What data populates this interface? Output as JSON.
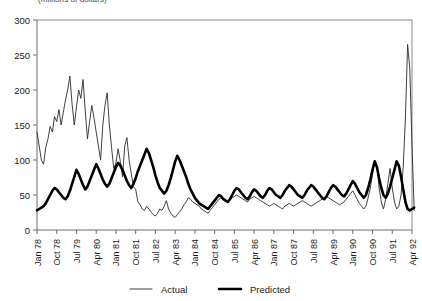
{
  "chart_data": {
    "type": "line",
    "title": "(millions of dollars)",
    "xlabel": "",
    "ylabel": "",
    "ylim": [
      0,
      300
    ],
    "ytick_values": [
      0,
      50,
      100,
      150,
      200,
      250,
      300
    ],
    "ytick_labels": [
      "0",
      "50",
      "100",
      "150",
      "200",
      "250",
      "300"
    ],
    "grid": false,
    "legend_position": "bottom",
    "x_tick_labels": [
      "Jan 78",
      "Oct 78",
      "Jul 79",
      "Apr 80",
      "Jan 81",
      "Oct 81",
      "Jul 82",
      "Apr 83",
      "Jan 84",
      "Oct 84",
      "Jul 85",
      "Apr 86",
      "Jan 87",
      "Oct 87",
      "Jul 88",
      "Apr 89",
      "Jan 90",
      "Oct 90",
      "Jul 91",
      "Apr 92"
    ],
    "x_tick_indices": [
      0,
      9,
      18,
      27,
      36,
      45,
      54,
      63,
      72,
      81,
      90,
      99,
      108,
      117,
      126,
      135,
      144,
      153,
      162,
      171
    ],
    "x_label_rotation": -90,
    "n_points": 172,
    "series": [
      {
        "name": "Actual",
        "line_style": "thin",
        "color": "#2b2b2b",
        "values": [
          140,
          120,
          100,
          94,
          118,
          130,
          148,
          140,
          162,
          155,
          172,
          150,
          168,
          186,
          200,
          220,
          180,
          150,
          176,
          200,
          188,
          215,
          170,
          130,
          155,
          178,
          160,
          140,
          120,
          100,
          150,
          178,
          196,
          150,
          118,
          88,
          96,
          116,
          98,
          76,
          120,
          132,
          100,
          80,
          62,
          58,
          40,
          36,
          30,
          28,
          34,
          30,
          26,
          22,
          20,
          24,
          30,
          28,
          34,
          42,
          30,
          24,
          20,
          18,
          22,
          26,
          30,
          36,
          40,
          46,
          44,
          40,
          38,
          36,
          34,
          30,
          28,
          26,
          24,
          28,
          32,
          36,
          40,
          44,
          46,
          44,
          42,
          40,
          44,
          46,
          48,
          50,
          48,
          46,
          44,
          42,
          40,
          44,
          46,
          48,
          46,
          44,
          42,
          40,
          38,
          36,
          34,
          36,
          38,
          36,
          34,
          32,
          30,
          34,
          36,
          38,
          36,
          34,
          36,
          38,
          40,
          42,
          40,
          38,
          36,
          34,
          36,
          38,
          40,
          42,
          44,
          46,
          48,
          46,
          44,
          42,
          40,
          38,
          36,
          38,
          40,
          44,
          48,
          52,
          56,
          50,
          44,
          38,
          34,
          30,
          34,
          46,
          60,
          80,
          100,
          92,
          60,
          40,
          30,
          44,
          66,
          88,
          60,
          40,
          30,
          34,
          50,
          90,
          160,
          265,
          230,
          120,
          28
        ]
      },
      {
        "name": "Predicted",
        "line_style": "thick",
        "color": "#000000",
        "values": [
          28,
          30,
          32,
          34,
          38,
          44,
          50,
          56,
          60,
          58,
          54,
          50,
          46,
          44,
          48,
          56,
          66,
          76,
          86,
          80,
          72,
          64,
          58,
          62,
          70,
          78,
          86,
          94,
          88,
          80,
          72,
          66,
          62,
          66,
          74,
          82,
          90,
          96,
          92,
          86,
          78,
          70,
          64,
          60,
          66,
          74,
          84,
          92,
          100,
          108,
          116,
          110,
          100,
          90,
          78,
          68,
          60,
          56,
          52,
          56,
          64,
          74,
          86,
          98,
          106,
          100,
          92,
          84,
          76,
          66,
          58,
          52,
          46,
          42,
          38,
          36,
          34,
          32,
          30,
          34,
          38,
          42,
          46,
          50,
          48,
          44,
          42,
          40,
          44,
          50,
          56,
          60,
          58,
          54,
          50,
          46,
          44,
          48,
          54,
          58,
          56,
          52,
          48,
          46,
          50,
          56,
          60,
          58,
          54,
          50,
          48,
          46,
          50,
          56,
          60,
          64,
          62,
          58,
          54,
          50,
          48,
          46,
          50,
          56,
          60,
          64,
          62,
          58,
          54,
          50,
          46,
          44,
          48,
          54,
          60,
          64,
          62,
          58,
          54,
          50,
          48,
          52,
          58,
          64,
          70,
          66,
          60,
          54,
          50,
          46,
          50,
          60,
          72,
          86,
          98,
          90,
          74,
          60,
          50,
          46,
          52,
          62,
          74,
          86,
          98,
          92,
          76,
          58,
          40,
          30,
          28,
          30,
          32
        ]
      }
    ]
  },
  "axis": {
    "y_axis_label_top": "300",
    "y_axis_label_bottom": "0"
  },
  "legend": {
    "items": [
      {
        "label": "Actual",
        "style": "thin"
      },
      {
        "label": "Predicted",
        "style": "thick"
      }
    ]
  }
}
